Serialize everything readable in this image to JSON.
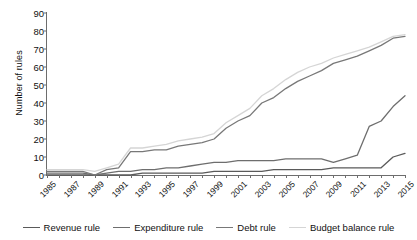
{
  "chart_data": {
    "type": "line",
    "title": "",
    "xlabel": "",
    "ylabel": "Number of rules",
    "ylim": [
      0,
      90
    ],
    "ytick_step": 10,
    "yticks": [
      0,
      10,
      20,
      30,
      40,
      50,
      60,
      70,
      80,
      90
    ],
    "grid": false,
    "legend_position": "bottom",
    "x": [
      1985,
      1986,
      1987,
      1988,
      1989,
      1990,
      1991,
      1992,
      1993,
      1994,
      1995,
      1996,
      1997,
      1998,
      1999,
      2000,
      2001,
      2002,
      2003,
      2004,
      2005,
      2006,
      2007,
      2008,
      2009,
      2010,
      2011,
      2012,
      2013,
      2014,
      2015
    ],
    "xtick_labels": [
      "1985",
      "1987",
      "1989",
      "1991",
      "1993",
      "1995",
      "1997",
      "1999",
      "2001",
      "2003",
      "2005",
      "2007",
      "2009",
      "2011",
      "2013",
      "2015"
    ],
    "series": [
      {
        "name": "Revenue rule",
        "color": "#5a5a5a",
        "values": [
          0,
          0,
          0,
          0,
          0,
          0,
          0,
          0,
          1,
          1,
          1,
          1,
          1,
          1,
          2,
          2,
          2,
          2,
          2,
          3,
          3,
          3,
          3,
          3,
          4,
          4,
          4,
          4,
          4,
          10,
          12
        ]
      },
      {
        "name": "Expenditure rule",
        "color": "#6e6e6e",
        "values": [
          1,
          1,
          1,
          1,
          0,
          1,
          2,
          2,
          3,
          3,
          4,
          4,
          5,
          6,
          7,
          7,
          8,
          8,
          8,
          8,
          9,
          9,
          9,
          9,
          7,
          9,
          11,
          27,
          30,
          38,
          44
        ]
      },
      {
        "name": "Debt rule",
        "color": "#787878",
        "values": [
          2,
          2,
          2,
          2,
          0,
          3,
          4,
          13,
          13,
          14,
          14,
          16,
          17,
          18,
          20,
          26,
          30,
          33,
          40,
          43,
          48,
          52,
          55,
          58,
          62,
          64,
          66,
          69,
          72,
          76,
          77
        ]
      },
      {
        "name": "Budget balance rule",
        "color": "#d5d5d5",
        "values": [
          3,
          3,
          3,
          3,
          2,
          4,
          6,
          15,
          15,
          16,
          17,
          19,
          20,
          21,
          23,
          29,
          33,
          37,
          44,
          48,
          53,
          57,
          60,
          62,
          65,
          67,
          69,
          71,
          74,
          77,
          78
        ]
      }
    ]
  },
  "legend": {
    "items": [
      {
        "label": "Revenue rule",
        "color": "#5a5a5a"
      },
      {
        "label": "Expenditure rule",
        "color": "#6e6e6e"
      },
      {
        "label": "Debt rule",
        "color": "#787878"
      },
      {
        "label": "Budget balance rule",
        "color": "#d5d5d5"
      }
    ]
  }
}
